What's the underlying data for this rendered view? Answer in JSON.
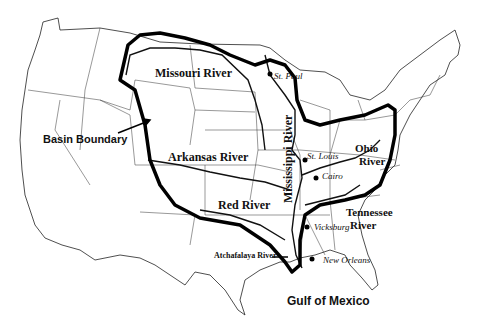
{
  "map": {
    "title": "Mississippi River Basin",
    "labels": {
      "missouri": "Missouri River",
      "st_paul": "St. Paul",
      "mississippi": "Mississippi River",
      "basin_boundary": "Basin Boundary",
      "arkansas": "Arkansas River",
      "st_louis": "St. Louis",
      "ohio_1": "Ohio",
      "ohio_2": "River",
      "cairo": "Cairo",
      "red": "Red River",
      "tennessee_1": "Tennessee",
      "tennessee_2": "River",
      "vicksburg": "Vicksburg",
      "atchafalaya": "Atchafalaya River",
      "new_orleans": "New Orleans",
      "gulf": "Gulf of Mexico"
    },
    "colors": {
      "ink": "#111111",
      "background": "#ffffff"
    }
  }
}
